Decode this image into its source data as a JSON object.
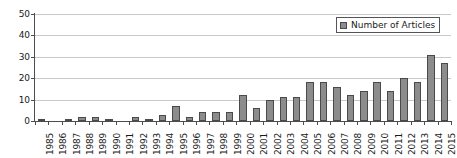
{
  "chart_data": {
    "type": "bar",
    "title": "",
    "xlabel": "",
    "ylabel": "",
    "ylim": [
      0,
      50
    ],
    "ytick_step": 10,
    "yticks": [
      0,
      10,
      20,
      30,
      40,
      50
    ],
    "grid": true,
    "legend_position": "top-right",
    "categories": [
      "1985",
      "1986",
      "1987",
      "1988",
      "1989",
      "1990",
      "1991",
      "1992",
      "1993",
      "1994",
      "1995",
      "1996",
      "1997",
      "1998",
      "1999",
      "2000",
      "2001",
      "2002",
      "2003",
      "2004",
      "2005",
      "2006",
      "2007",
      "2008",
      "2009",
      "2010",
      "2011",
      "2012",
      "2013",
      "2014",
      "2015"
    ],
    "series": [
      {
        "name": "Number of Articles",
        "color": "#8c8c8c",
        "values": [
          1,
          0,
          1,
          2,
          2,
          1,
          0,
          2,
          1,
          3,
          7,
          2,
          4,
          4,
          4,
          12,
          6,
          10,
          11,
          11,
          18,
          18,
          16,
          12,
          14,
          18,
          14,
          20,
          18,
          31,
          27
        ]
      }
    ]
  },
  "legend": {
    "label": "Number of Articles",
    "swatch_color": "#8c8c8c"
  },
  "axis_colors": {
    "axis_line": "#4d4d4d",
    "gridline": "#c9c9c9",
    "bar_fill": "#8c8c8c",
    "bar_border": "#4a4a4a",
    "text": "#1a1a1a"
  }
}
